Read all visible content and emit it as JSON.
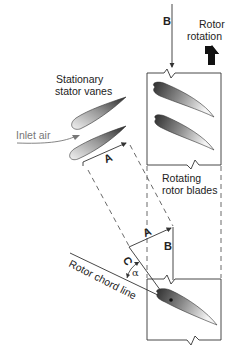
{
  "diagram": {
    "labels": {
      "b_top": "B",
      "rotor_rotation_line1": "Rotor",
      "rotor_rotation_line2": "rotation",
      "stator_line1": "Stationary",
      "stator_line2": "stator vanes",
      "inlet_air": "Inlet air",
      "vector_a_upper": "A",
      "rotating_line1": "Rotating",
      "rotating_line2": "rotor blades",
      "vector_a_lower": "A",
      "vector_b_lower": "B",
      "vector_c": "C",
      "alpha": "α",
      "rotor_chord_line": "Rotor chord line"
    },
    "icons": {
      "rotation_arrow": "up-arrow-icon"
    },
    "colors": {
      "line": "#333333",
      "airfoil_dark": "#3a3a3a",
      "airfoil_light": "#f2f2f2",
      "inlet_air_text": "#777777"
    }
  }
}
